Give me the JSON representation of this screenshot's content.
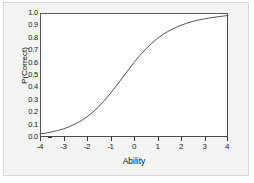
{
  "chart_data": {
    "type": "line",
    "title": "",
    "subtitle": "",
    "xlabel": "Ability",
    "ylabel": "P(Correct)",
    "xlim": [
      -4,
      4
    ],
    "ylim": [
      0.0,
      1.0
    ],
    "grid": false,
    "legend": false,
    "legend_position": "none",
    "xticks": [
      -4,
      -3,
      -2,
      -1,
      0,
      1,
      2,
      3,
      4
    ],
    "xtick_labels": [
      "-4",
      "-3",
      "-2",
      "-1",
      "0",
      "1",
      "2",
      "3",
      "4"
    ],
    "yticks": [
      0.0,
      0.1,
      0.2,
      0.3,
      0.4,
      0.5,
      0.6,
      0.7,
      0.8,
      0.9,
      1.0
    ],
    "ytick_labels": [
      "0.0",
      "0.1",
      "0.2",
      "0.3",
      "0.4",
      "0.5",
      "0.6",
      "0.7",
      "0.8",
      "0.9",
      "1.0"
    ],
    "series": [
      {
        "name": "Item Characteristic Curve",
        "color": "#555555",
        "x": [
          -4.0,
          -3.75,
          -3.5,
          -3.25,
          -3.0,
          -2.75,
          -2.5,
          -2.25,
          -2.0,
          -1.75,
          -1.5,
          -1.25,
          -1.0,
          -0.75,
          -0.5,
          -0.25,
          0.0,
          0.25,
          0.5,
          0.75,
          1.0,
          1.25,
          1.5,
          1.75,
          2.0,
          2.25,
          2.5,
          2.75,
          3.0,
          3.25,
          3.5,
          3.75,
          4.0
        ],
        "y": [
          0.025,
          0.032,
          0.041,
          0.052,
          0.066,
          0.083,
          0.105,
          0.131,
          0.163,
          0.201,
          0.245,
          0.296,
          0.352,
          0.413,
          0.476,
          0.539,
          0.6,
          0.657,
          0.709,
          0.755,
          0.795,
          0.829,
          0.857,
          0.881,
          0.901,
          0.918,
          0.932,
          0.944,
          0.953,
          0.961,
          0.968,
          0.974,
          0.98
        ]
      }
    ]
  },
  "axes": {
    "y_title": "P(Correct)",
    "x_title": "Ability"
  }
}
